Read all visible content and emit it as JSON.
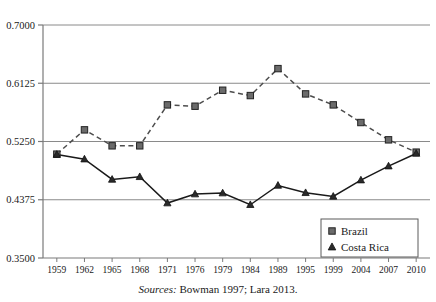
{
  "chart_data": {
    "type": "line",
    "title": "",
    "xlabel": "",
    "ylabel": "",
    "categories": [
      "1959",
      "1962",
      "1965",
      "1968",
      "1971",
      "1976",
      "1979",
      "1984",
      "1989",
      "1995",
      "1999",
      "2004",
      "2007",
      "2010"
    ],
    "ylim": [
      0.35,
      0.7
    ],
    "yticks": [
      "0.7000",
      "0.6125",
      "0.5250",
      "0.4375",
      "0.3500"
    ],
    "ytick_values": [
      0.7,
      0.6125,
      0.525,
      0.4375,
      0.35
    ],
    "grid": "horizontal",
    "legend_position": "bottom-right",
    "series": [
      {
        "name": "Brazil",
        "marker": "square",
        "linestyle": "dashed",
        "color": "#4d4d4d",
        "values": [
          0.506,
          0.5425,
          0.5185,
          0.5185,
          0.58,
          0.578,
          0.602,
          0.594,
          0.6345,
          0.5965,
          0.58,
          0.5535,
          0.5275,
          0.509
        ]
      },
      {
        "name": "Costa Rica",
        "marker": "triangle",
        "linestyle": "solid",
        "color": "#1a1a1a",
        "values": [
          0.5055,
          0.4985,
          0.468,
          0.472,
          0.4325,
          0.446,
          0.4475,
          0.43,
          0.459,
          0.448,
          0.4425,
          0.467,
          0.488,
          0.507
        ]
      }
    ]
  },
  "legend": {
    "items": [
      {
        "label": "Brazil",
        "marker": "square"
      },
      {
        "label": "Costa Rica",
        "marker": "triangle"
      }
    ]
  },
  "caption": {
    "source_word": "Sources:",
    "source_text": " Bowman 1997; Lara 2013."
  },
  "colors": {
    "axis": "#7a7a7a",
    "grid": "#8a8a8a",
    "brazil": "#4d4d4d",
    "costa_rica": "#1a1a1a",
    "text": "#1a1a1a"
  }
}
